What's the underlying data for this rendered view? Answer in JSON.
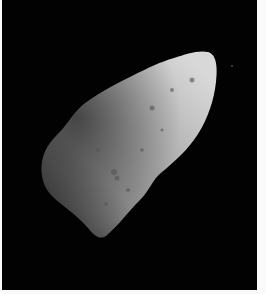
{
  "image": {
    "subject": "asteroid",
    "alt": "Grayscale photograph of an elongated cratered asteroid against a black space background",
    "colors": {
      "background": "#020202",
      "border": "#fafafa",
      "surface_light": "#c8c8c8",
      "surface_dark": "#2a2a2a"
    }
  }
}
